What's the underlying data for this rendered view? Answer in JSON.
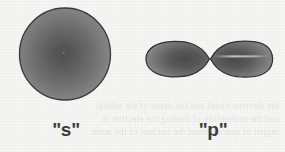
{
  "figure": {
    "background_color": "#f6f6f4",
    "width": 285,
    "height": 152
  },
  "orbitals": [
    {
      "id": "s-orbital",
      "label": "\"s\"",
      "shape": "sphere",
      "description": "Spherical s orbital drawn as a shaded circle",
      "center_x": 65,
      "center_y": 54,
      "radius": 46,
      "fill_center_color": "#585858",
      "fill_edge_color": "#8a8a8a",
      "outline_color": "#3a3a3a"
    },
    {
      "id": "p-orbital",
      "label": "\"p\"",
      "shape": "dumbbell",
      "description": "Dumbbell p orbital drawn as two pointed lobes meeting at a central node",
      "node_x": 210,
      "center_y": 59,
      "left_lobe_tip_x": 146,
      "right_lobe_tip_x": 272,
      "lobe_half_height": 17,
      "fill_center_color": "#4f4f4f",
      "fill_edge_color": "#858585",
      "outline_color": "#333333",
      "highlight_color": "#d8d8d4"
    }
  ],
  "bleed_through_text": {
    "note": "Faint mirrored show-through text from the reverse of the scanned page",
    "lines": [
      "the electron cloud and the shape of the orbital",
      "and the probability of finding the electron in",
      "region of space around the nucleus of the atom"
    ]
  }
}
